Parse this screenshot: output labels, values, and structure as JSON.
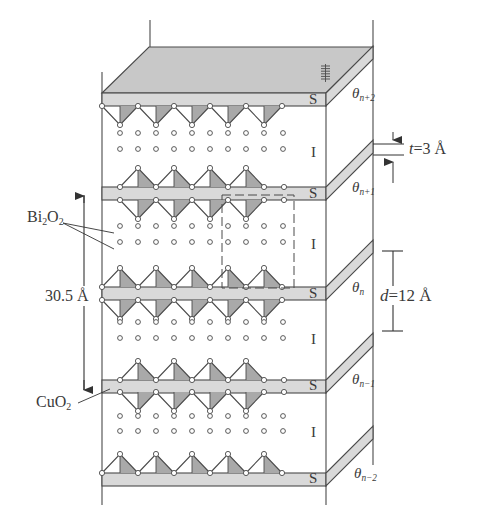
{
  "diagram": {
    "title": "",
    "colors": {
      "line": "#4a4a4a",
      "plate": "#d9d9d9",
      "plate_top": "#c8c8c8",
      "tri_fill": "#a9a9a9",
      "atom_fill": "#ffffff"
    },
    "layers": [
      {
        "id": "s-n+2",
        "type": "S",
        "label": "S",
        "theta": "θ",
        "theta_sub": "n+2"
      },
      {
        "id": "s-n+1",
        "type": "S",
        "label": "S",
        "theta": "θ",
        "theta_sub": "n+1"
      },
      {
        "id": "s-n",
        "type": "S",
        "label": "S",
        "theta": "θ",
        "theta_sub": "n"
      },
      {
        "id": "s-n-1",
        "type": "S",
        "label": "S",
        "theta": "θ",
        "theta_sub": "n−1"
      },
      {
        "id": "s-n-2",
        "type": "S",
        "label": "S",
        "theta": "θ",
        "theta_sub": "n−2"
      }
    ],
    "insulator_label": "I",
    "annotations": {
      "bi2o2": {
        "main": "Bi",
        "sub1": "2",
        "mid": "O",
        "sub2": "2"
      },
      "cuo2": {
        "main": "CuO",
        "sub": "2"
      },
      "period": "30.5 Å",
      "thickness": {
        "var": "t",
        "value": "=3 Å"
      },
      "spacing": {
        "var": "d",
        "value": "=12 Å"
      }
    }
  }
}
